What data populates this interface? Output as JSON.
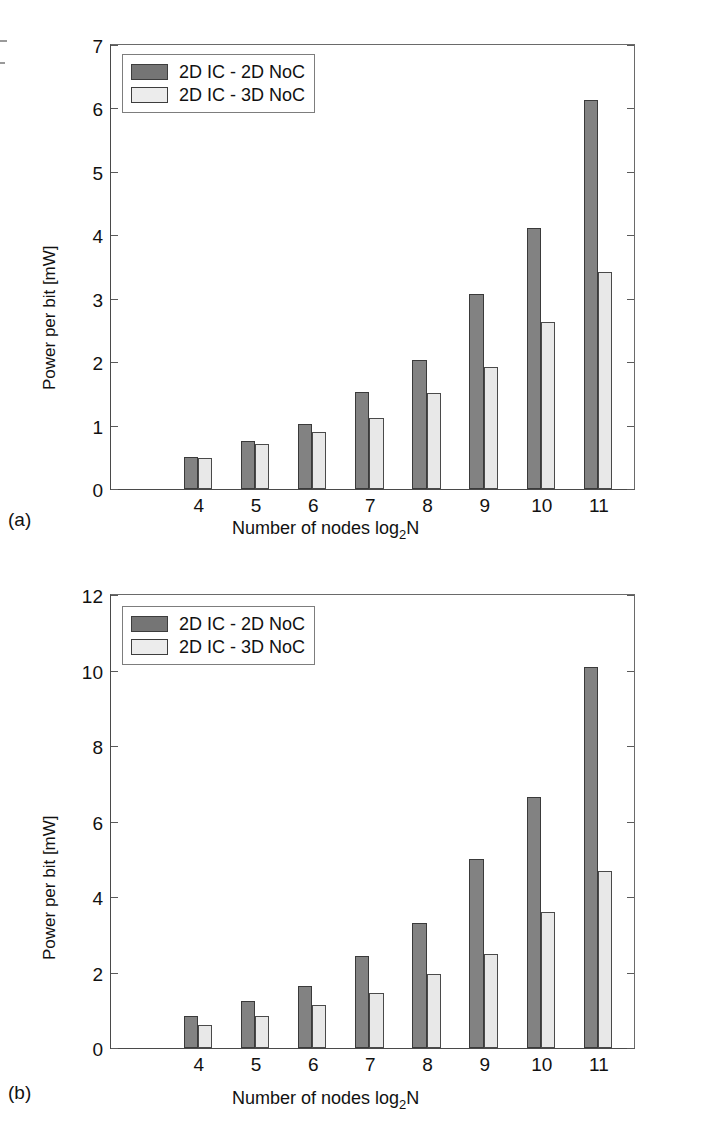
{
  "figure": {
    "panels": [
      {
        "id": "a",
        "caption": "(a)",
        "legend": [
          {
            "label": "2D IC - 2D NoC",
            "color": "#757575"
          },
          {
            "label": "2D IC - 3D NoC",
            "color": "#ececec"
          }
        ],
        "yticks": [
          "0",
          "1",
          "2",
          "3",
          "4",
          "5",
          "6",
          "7"
        ],
        "xticks": [
          "4",
          "5",
          "6",
          "7",
          "8",
          "9",
          "10",
          "11"
        ]
      },
      {
        "id": "b",
        "caption": "(b)",
        "legend": [
          {
            "label": "2D IC - 2D NoC",
            "color": "#757575"
          },
          {
            "label": "2D IC - 3D NoC",
            "color": "#ececec"
          }
        ],
        "yticks": [
          "0",
          "2",
          "4",
          "6",
          "8",
          "10",
          "12"
        ],
        "xticks": [
          "4",
          "5",
          "6",
          "7",
          "8",
          "9",
          "10",
          "11"
        ]
      }
    ]
  },
  "chart_data": [
    {
      "type": "bar",
      "panel": "a",
      "title": "",
      "xlabel": "Number of nodes log2N",
      "xlabel_parts": {
        "pre": "Number of nodes log",
        "sub": "2",
        "post": "N"
      },
      "ylabel": "Power per bit [mW]",
      "categories": [
        "4",
        "5",
        "6",
        "7",
        "8",
        "9",
        "10",
        "11"
      ],
      "series": [
        {
          "name": "2D IC - 2D NoC",
          "color": "#828282",
          "values": [
            0.5,
            0.76,
            1.02,
            1.53,
            2.04,
            3.07,
            4.11,
            6.13
          ]
        },
        {
          "name": "2D IC - 3D NoC",
          "color": "#e8e8e8",
          "values": [
            0.49,
            0.71,
            0.9,
            1.12,
            1.52,
            1.92,
            2.64,
            3.42
          ]
        }
      ],
      "ylim": [
        0,
        7
      ],
      "ytick_step": 1,
      "grid": false,
      "legend_position": "top-left"
    },
    {
      "type": "bar",
      "panel": "b",
      "title": "",
      "xlabel": "Number of nodes log2N",
      "xlabel_parts": {
        "pre": "Number of nodes log",
        "sub": "2",
        "post": "N"
      },
      "ylabel": "Power per bit [mW]",
      "categories": [
        "4",
        "5",
        "6",
        "7",
        "8",
        "9",
        "10",
        "11"
      ],
      "series": [
        {
          "name": "2D IC - 2D NoC",
          "color": "#828282",
          "values": [
            0.85,
            1.25,
            1.65,
            2.45,
            3.3,
            5.0,
            6.65,
            10.1
          ]
        },
        {
          "name": "2D IC - 3D NoC",
          "color": "#e8e8e8",
          "values": [
            0.6,
            0.85,
            1.15,
            1.45,
            1.95,
            2.5,
            3.6,
            4.7
          ]
        }
      ],
      "ylim": [
        0,
        12
      ],
      "ytick_step": 2,
      "grid": false,
      "legend_position": "top-left"
    }
  ]
}
